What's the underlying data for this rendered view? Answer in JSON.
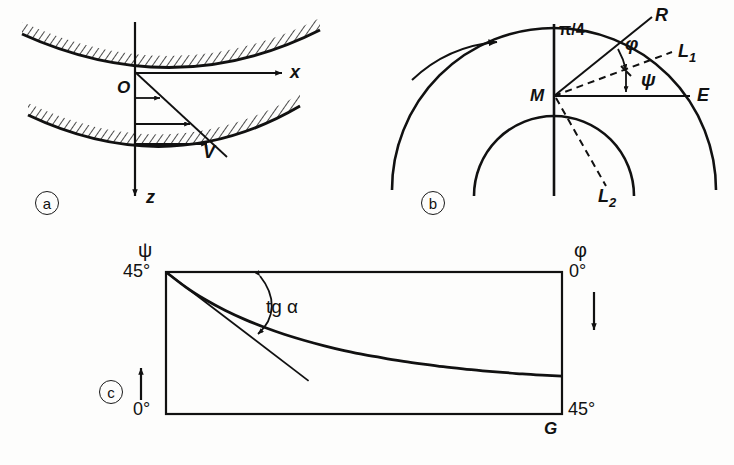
{
  "figure": {
    "panels": [
      {
        "tag": "a",
        "name": "channel-velocity-profile",
        "labels": {
          "origin": "O",
          "x_axis": "x",
          "z_axis": "z",
          "velocity": "V"
        }
      },
      {
        "tag": "b",
        "name": "rotating-arcs-angles",
        "labels": {
          "center": "M",
          "ray_r": "R",
          "ray_e": "E",
          "line_l1": "L",
          "line_l1_sub": "1",
          "line_l2": "L",
          "line_l2_sub": "2",
          "quarter_pi": "π/4",
          "angle_phi": "φ",
          "angle_psi": "ψ"
        }
      },
      {
        "tag": "c",
        "name": "psi-phi-plot",
        "labels": {
          "y_axis_symbol": "ψ",
          "y_axis_top": "45°",
          "y_axis_bottom": "0°",
          "right_axis_symbol": "φ",
          "right_axis_top": "0°",
          "right_axis_bottom": "45°",
          "tangent_annotation": "tg α",
          "x_axis_symbol": "G"
        }
      }
    ]
  },
  "chart_data": {
    "type": "line",
    "title": "",
    "xlabel": "G",
    "ylabel": "ψ",
    "y2label": "φ",
    "ylim": [
      0,
      45
    ],
    "y2lim": [
      0,
      45
    ],
    "xlim": [
      0,
      1
    ],
    "grid": false,
    "legend": null,
    "ytick_labels": [
      "45°",
      "0°"
    ],
    "y2tick_labels": [
      "0°",
      "45°"
    ],
    "annotations": [
      "tg α"
    ],
    "series": [
      {
        "name": "psi-vs-G",
        "x": [
          0.0,
          0.05,
          0.1,
          0.15,
          0.2,
          0.25,
          0.3,
          0.35,
          0.4,
          0.45,
          0.5,
          0.55,
          0.6,
          0.65,
          0.7,
          0.75,
          0.8,
          0.85,
          0.9,
          0.95,
          1.0
        ],
        "values": [
          45.0,
          40.2,
          36.2,
          32.8,
          29.9,
          27.4,
          25.2,
          23.3,
          21.6,
          20.1,
          18.8,
          17.7,
          16.7,
          15.8,
          15.0,
          14.3,
          13.7,
          13.2,
          12.7,
          12.3,
          12.0
        ]
      },
      {
        "name": "tangent-at-origin",
        "x": [
          0.0,
          0.36
        ],
        "values": [
          45.0,
          10.5
        ]
      }
    ]
  },
  "colors": {
    "ink": "#111111",
    "background": "#fdfdfc"
  }
}
